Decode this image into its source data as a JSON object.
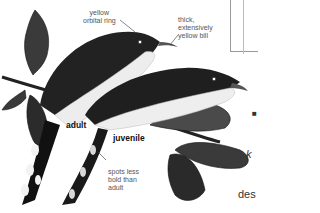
{
  "illustration": {
    "subject": "cuckoo-pair-on-branch",
    "birds": [
      {
        "id": "adult",
        "label": "adult"
      },
      {
        "id": "juvenile",
        "label": "juvenile"
      }
    ]
  },
  "annotations": {
    "orbital_ring": "yellow\norbital ring",
    "bill": "thick,\nextensively\nyellow bill",
    "spots": "spots less\nbold than\nadult"
  },
  "labels": {
    "adult": "adult",
    "juvenile": "juvenile"
  },
  "side_text": {
    "bullet": "■",
    "lines": [
      "k",
      "des",
      "ho",
      "(",
      "",
      "",
      "der",
      "clea"
    ]
  },
  "colors": {
    "ink": "#111111",
    "label_gray": "#555555",
    "leaf_dark": "#2f2f2f",
    "belly": "#f2f2f2"
  }
}
